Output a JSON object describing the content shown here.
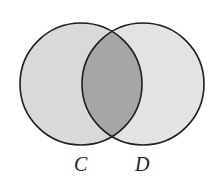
{
  "diagram": {
    "type": "venn",
    "sets": [
      {
        "name": "C",
        "label": "C",
        "fill": "#d9d9d9"
      },
      {
        "name": "D",
        "label": "D",
        "fill": "#e6e6e6"
      }
    ],
    "intersection": {
      "sets": [
        "C",
        "D"
      ],
      "fill": "#a5a5a5",
      "shaded": true
    },
    "stroke_color": "#1e1e1e"
  }
}
